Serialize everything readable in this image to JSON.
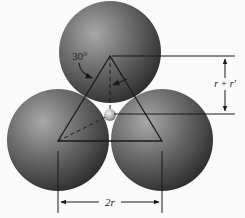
{
  "diagram": {
    "labels": {
      "angle": "30°",
      "height": "r + r′",
      "width": "2r"
    },
    "spheres": [
      {
        "name": "top",
        "cx": 110,
        "cy": 52,
        "r": 51
      },
      {
        "name": "bottom-left",
        "cx": 58,
        "cy": 140,
        "r": 51
      },
      {
        "name": "bottom-right",
        "cx": 162,
        "cy": 140,
        "r": 51
      },
      {
        "name": "small-interstitial",
        "cx": 110,
        "cy": 115,
        "r": 6
      }
    ],
    "colors": {
      "background": "#fafafa",
      "sphere_light": "#9a9a9a",
      "sphere_dark": "#2e2e2e",
      "line": "#1a1a1a"
    }
  }
}
